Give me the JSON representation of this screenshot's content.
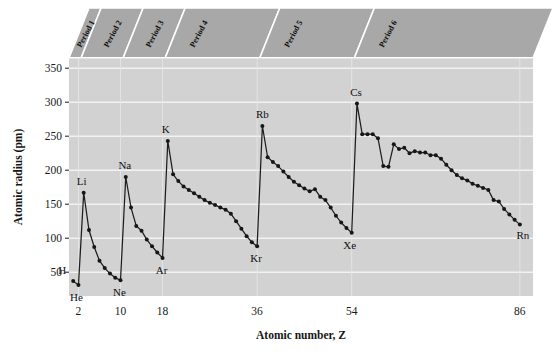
{
  "figure": {
    "background_color": "#ffffff",
    "plot_background_color": "#d2d2d2",
    "band_color": "#a8a8a8",
    "gridline_color": "#f2f2f2",
    "line_color": "#1d1d1d",
    "marker_color": "#161616"
  },
  "axes": {
    "y_title": "Atomic radius (pm)",
    "x_title": "Atomic number, Z",
    "y_ticks": [
      50,
      100,
      150,
      200,
      250,
      300,
      350
    ],
    "y_tick_labels": [
      "50",
      "100",
      "150",
      "200",
      "250",
      "300",
      "350"
    ],
    "x_ticks": [
      2,
      10,
      18,
      36,
      54,
      86
    ],
    "x_tick_labels": [
      "2",
      "10",
      "18",
      "36",
      "54",
      "86"
    ],
    "ylim": [
      15,
      365
    ],
    "xlim": [
      0.2,
      88.5
    ],
    "grid": "horizontal"
  },
  "period_bands": [
    {
      "label": "Period 1",
      "start": 1,
      "end": 2
    },
    {
      "label": "Period 2",
      "start": 3,
      "end": 10
    },
    {
      "label": "Period 3",
      "start": 11,
      "end": 18
    },
    {
      "label": "Period 4",
      "start": 19,
      "end": 36
    },
    {
      "label": "Period 5",
      "start": 37,
      "end": 54
    },
    {
      "label": "Period 6",
      "start": 55,
      "end": 86
    }
  ],
  "point_labels": [
    {
      "text": "H",
      "z": 1,
      "r": 37,
      "dx": -11,
      "dy": -7
    },
    {
      "text": "He",
      "z": 2,
      "r": 31,
      "dx": -2,
      "dy": 16
    },
    {
      "text": "Li",
      "z": 3,
      "r": 167,
      "dx": -2,
      "dy": -8
    },
    {
      "text": "Ne",
      "z": 10,
      "r": 38,
      "dx": -1,
      "dy": 16
    },
    {
      "text": "Na",
      "z": 11,
      "r": 190,
      "dx": -1,
      "dy": -8
    },
    {
      "text": "Ar",
      "z": 18,
      "r": 71,
      "dx": -1,
      "dy": 16
    },
    {
      "text": "K",
      "z": 19,
      "r": 243,
      "dx": -2,
      "dy": -8
    },
    {
      "text": "Kr",
      "z": 36,
      "r": 88,
      "dx": -1,
      "dy": 16
    },
    {
      "text": "Rb",
      "z": 37,
      "r": 265,
      "dx": 0,
      "dy": -8
    },
    {
      "text": "Xe",
      "z": 54,
      "r": 108,
      "dx": -2,
      "dy": 16
    },
    {
      "text": "Cs",
      "z": 55,
      "r": 298,
      "dx": -1,
      "dy": -8
    },
    {
      "text": "Rn",
      "z": 86,
      "r": 120,
      "dx": 3,
      "dy": 14
    }
  ],
  "chart_data": {
    "type": "line",
    "title": "",
    "xlabel": "Atomic number, Z",
    "ylabel": "Atomic radius (pm)",
    "xlim": [
      0.2,
      88.5
    ],
    "ylim": [
      15,
      365
    ],
    "grid": true,
    "legend": "none",
    "x_name": "Atomic number, Z",
    "y_name": "Atomic radius (pm)",
    "x": [
      1,
      2,
      3,
      4,
      5,
      6,
      7,
      8,
      9,
      10,
      11,
      12,
      13,
      14,
      15,
      16,
      17,
      18,
      19,
      20,
      21,
      22,
      23,
      24,
      25,
      26,
      27,
      28,
      29,
      30,
      31,
      32,
      33,
      34,
      35,
      36,
      37,
      38,
      39,
      40,
      41,
      42,
      43,
      44,
      45,
      46,
      47,
      48,
      49,
      50,
      51,
      52,
      53,
      54,
      55,
      56,
      57,
      58,
      59,
      60,
      61,
      62,
      63,
      64,
      65,
      66,
      67,
      68,
      69,
      70,
      71,
      72,
      73,
      74,
      75,
      76,
      77,
      78,
      79,
      80,
      81,
      82,
      83,
      84,
      85,
      86
    ],
    "values": [
      37,
      31,
      167,
      112,
      87,
      67,
      56,
      48,
      42,
      38,
      190,
      145,
      118,
      111,
      98,
      88,
      79,
      71,
      243,
      194,
      184,
      176,
      171,
      166,
      161,
      156,
      152,
      149,
      145,
      142,
      136,
      125,
      114,
      103,
      94,
      88,
      265,
      219,
      212,
      206,
      198,
      190,
      183,
      178,
      173,
      169,
      172,
      161,
      156,
      145,
      133,
      123,
      115,
      108,
      298,
      253,
      253,
      253,
      247,
      206,
      205,
      238,
      231,
      233,
      225,
      228,
      226,
      226,
      222,
      222,
      217,
      208,
      200,
      193,
      188,
      185,
      180,
      177,
      174,
      171,
      156,
      154,
      143,
      135,
      127,
      120
    ]
  }
}
